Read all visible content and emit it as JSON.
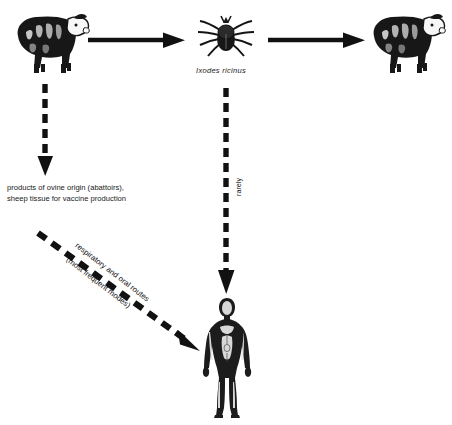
{
  "diagram": {
    "nodes": [
      {
        "id": "sheep-left",
        "name": "sheep",
        "label": ""
      },
      {
        "id": "tick",
        "name": "tick",
        "label": "Ixodes ricinus"
      },
      {
        "id": "sheep-right",
        "name": "sheep",
        "label": ""
      },
      {
        "id": "human",
        "name": "human",
        "label": ""
      }
    ],
    "captions": {
      "tick_species": "Ixodes ricinus"
    },
    "labels": {
      "products_line1": "products of ovine origin (abattoirs),",
      "products_line2": "sheep tissue for vaccine production",
      "tick_bite_route": "rarely",
      "diagonal_line1": "respiratory and oral routes",
      "diagonal_line2": "(most frequent modes)"
    },
    "edges": [
      {
        "id": "sheep-to-tick",
        "style": "solid",
        "direction": "right",
        "label": ""
      },
      {
        "id": "tick-to-sheep",
        "style": "solid",
        "direction": "right",
        "label": ""
      },
      {
        "id": "sheep-to-products",
        "style": "dashed",
        "direction": "down",
        "label": ""
      },
      {
        "id": "tick-to-human",
        "style": "dashed",
        "direction": "down",
        "label": "rarely"
      },
      {
        "id": "products-to-human",
        "style": "dashed",
        "direction": "down-right",
        "label": "respiratory and oral routes (most frequent modes)"
      }
    ],
    "colors": {
      "ink": "#111111",
      "background": "#ffffff"
    }
  }
}
